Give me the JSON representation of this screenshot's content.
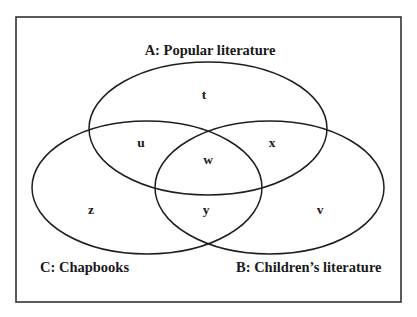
{
  "diagram": {
    "type": "venn",
    "frame": {
      "x": 16,
      "y": 17,
      "width": 385,
      "height": 285,
      "stroke": "#333333"
    },
    "line_color": "#1e1e1e",
    "text_color": "#1a1a1a",
    "sets": [
      {
        "id": "A",
        "label": "A: Popular literature",
        "ellipse": {
          "cx": 208,
          "cy": 128.5,
          "rx": 119,
          "ry": 66.5
        },
        "label_pos": {
          "x": 210,
          "y": 55,
          "anchor": "middle"
        }
      },
      {
        "id": "B",
        "label": "B: Children’s literature",
        "ellipse": {
          "cx": 269.5,
          "cy": 187.5,
          "rx": 114.5,
          "ry": 66.5
        },
        "label_pos": {
          "x": 236,
          "y": 272,
          "anchor": "start"
        }
      },
      {
        "id": "C",
        "label": "C: Chapbooks",
        "ellipse": {
          "cx": 147,
          "cy": 187.5,
          "rx": 115,
          "ry": 66.5
        },
        "label_pos": {
          "x": 40,
          "y": 272,
          "anchor": "start"
        }
      }
    ],
    "regions": [
      {
        "id": "t",
        "label": "t",
        "description": "A only",
        "x": 204,
        "y": 99
      },
      {
        "id": "u",
        "label": "u",
        "description": "A and C only",
        "x": 141,
        "y": 147
      },
      {
        "id": "x",
        "label": "x",
        "description": "A and B only",
        "x": 272,
        "y": 147
      },
      {
        "id": "w",
        "label": "w",
        "description": "A, B and C",
        "x": 208,
        "y": 164
      },
      {
        "id": "z",
        "label": "z",
        "description": "C only",
        "x": 91,
        "y": 214
      },
      {
        "id": "y",
        "label": "y",
        "description": "B and C only",
        "x": 206,
        "y": 214
      },
      {
        "id": "v",
        "label": "v",
        "description": "B only",
        "x": 320,
        "y": 214
      }
    ]
  }
}
